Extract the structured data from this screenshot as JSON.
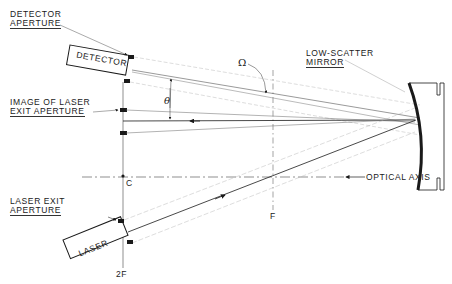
{
  "labels": {
    "detector_aperture_1": "DETECTOR",
    "detector_aperture_2": "APERTURE",
    "detector": "DETECTOR",
    "image_laser_1": "IMAGE OF LASER",
    "image_laser_2": "EXIT APERTURE",
    "theta": "θ",
    "omega": "Ω",
    "mirror_1": "LOW-SCATTER",
    "mirror_2": "MIRROR",
    "optical_axis": "OPTICAL AXIS",
    "center": "C",
    "focal": "F",
    "two_f": "2F",
    "laser_exit_1": "LASER EXIT",
    "laser_exit_2": "APERTURE",
    "laser": "LASER"
  },
  "colors": {
    "ink": "#1a1a1a",
    "faint": "#9a9a9a",
    "background": "#ffffff"
  }
}
